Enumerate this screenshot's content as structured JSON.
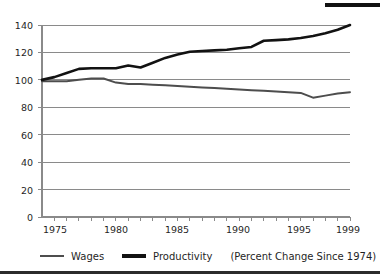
{
  "chart_data": {
    "type": "line",
    "title": "",
    "subtitle": "",
    "xlabel": "",
    "ylabel": "",
    "note": "(Percent Change Since 1974)",
    "xlim": [
      1974,
      1999
    ],
    "ylim": [
      0,
      140
    ],
    "yticks": [
      0,
      20,
      40,
      60,
      80,
      100,
      120,
      140
    ],
    "xticks": [
      1975,
      1980,
      1985,
      1990,
      1995,
      1999
    ],
    "x_minor_tick_step": 1,
    "grid": "horizontal",
    "legend_position": "bottom-left",
    "x": [
      1974,
      1975,
      1976,
      1977,
      1978,
      1979,
      1980,
      1981,
      1982,
      1983,
      1984,
      1985,
      1986,
      1987,
      1988,
      1989,
      1990,
      1991,
      1992,
      1993,
      1994,
      1995,
      1996,
      1997,
      1998,
      1999
    ],
    "series": [
      {
        "name": "Wages",
        "color": "#4d4d4d",
        "values": [
          99,
          99,
          99,
          100,
          101,
          101,
          98,
          97,
          97,
          96.5,
          96,
          95.5,
          95,
          94.5,
          94,
          93.5,
          93,
          92.5,
          92,
          91.5,
          91,
          90.5,
          87,
          88.5,
          90,
          91
        ]
      },
      {
        "name": "Productivity",
        "color": "#121212",
        "values": [
          100,
          102,
          105,
          108,
          108.5,
          108.5,
          108.5,
          110.5,
          109,
          112.5,
          116,
          118.5,
          120.5,
          121,
          121.5,
          122,
          123,
          124,
          128.5,
          129,
          129.5,
          130.5,
          132,
          134,
          136.5,
          140
        ]
      }
    ]
  },
  "legend": {
    "wages_label": "Wages",
    "productivity_label": "Productivity",
    "note": "(Percent Change Since 1974)"
  },
  "axes": {
    "y_labels": [
      "140",
      "120",
      "100",
      "80",
      "60",
      "40",
      "20",
      "0"
    ],
    "x_labels": [
      "1975",
      "1980",
      "1985",
      "1990",
      "1995",
      "1999"
    ]
  }
}
